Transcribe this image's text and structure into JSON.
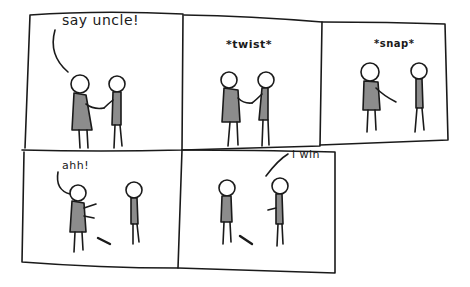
{
  "comic": {
    "panels": [
      {
        "id": 1,
        "caption": "say uncle!",
        "caption_type": "speech"
      },
      {
        "id": 2,
        "caption": "*twist*",
        "caption_type": "sound-effect"
      },
      {
        "id": 3,
        "caption": "*snap*",
        "caption_type": "sound-effect"
      },
      {
        "id": 4,
        "caption": "ahh!",
        "caption_type": "speech"
      },
      {
        "id": 5,
        "caption": "i win",
        "caption_type": "speech"
      }
    ]
  },
  "colors": {
    "ink": "#1a1a1a",
    "shirt_fill": "#8c8c8c",
    "background": "#ffffff"
  }
}
